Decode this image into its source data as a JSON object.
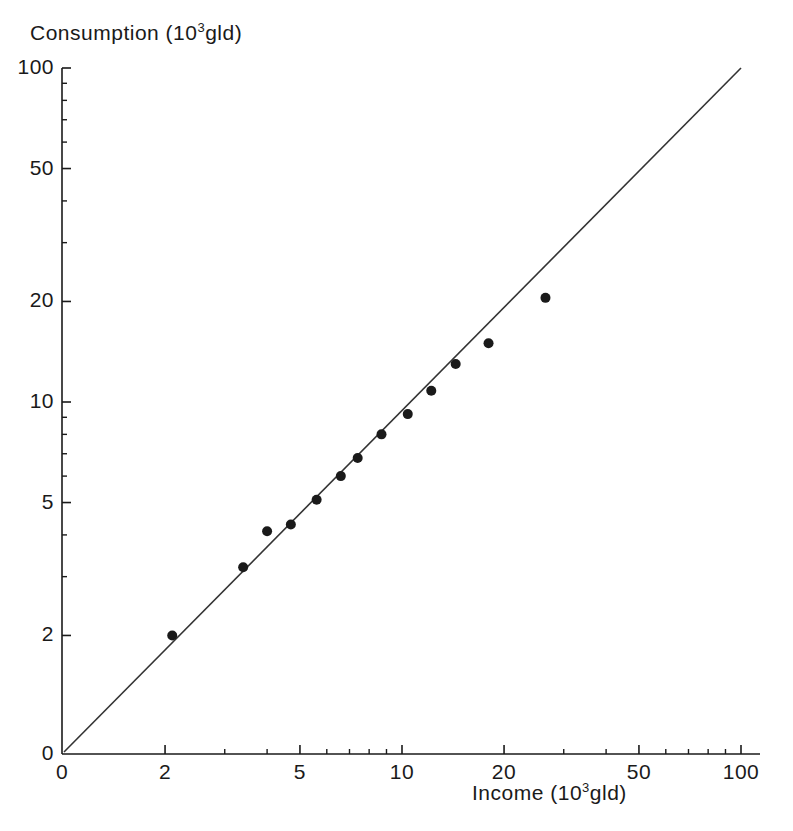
{
  "chart_data": {
    "type": "scatter",
    "title": "",
    "xlabel": "Income (10^3 gld)",
    "ylabel": "Consumption (10^3 gld)",
    "xlabel_main": "Income",
    "xlabel_unit_pre": "(10",
    "xlabel_unit_exp": "3",
    "xlabel_unit_post": "gld)",
    "ylabel_main": "Consumption",
    "ylabel_unit_pre": "(10",
    "ylabel_unit_exp": "3",
    "ylabel_unit_post": "gld)",
    "xscale": "log",
    "yscale": "log",
    "xlim": [
      1.55,
      110
    ],
    "ylim": [
      1.55,
      110
    ],
    "grid": false,
    "legend": "none",
    "x_ticks_major": [
      2,
      5,
      10,
      20,
      50,
      100
    ],
    "x_tick_labels": [
      "0",
      "2",
      "5",
      "10",
      "20",
      "50",
      "100"
    ],
    "x_origin_label": "0",
    "y_ticks_major": [
      2,
      5,
      10,
      20,
      50,
      100
    ],
    "y_tick_labels": [
      "0",
      "2",
      "5",
      "10",
      "20",
      "50",
      "100"
    ],
    "y_origin_label": "0",
    "x_ticks_minor": [
      3,
      4,
      6,
      7,
      8,
      9,
      30,
      40,
      60,
      70,
      80,
      90
    ],
    "y_ticks_minor": [
      3,
      4,
      6,
      7,
      8,
      9,
      30,
      40,
      60,
      70,
      80,
      90
    ],
    "reference_line": {
      "name": "identity-line",
      "from": [
        0,
        0
      ],
      "to": [
        100,
        100
      ],
      "label": "y = x"
    },
    "series": [
      {
        "name": "households",
        "marker": "filled-circle",
        "marker_color": "#1a1a1a",
        "points": [
          {
            "x": 2.1,
            "y": 2.0
          },
          {
            "x": 3.4,
            "y": 3.2
          },
          {
            "x": 4.0,
            "y": 4.1
          },
          {
            "x": 4.7,
            "y": 4.3
          },
          {
            "x": 5.6,
            "y": 5.1
          },
          {
            "x": 6.6,
            "y": 6.0
          },
          {
            "x": 7.4,
            "y": 6.8
          },
          {
            "x": 8.7,
            "y": 8.0
          },
          {
            "x": 10.4,
            "y": 9.2
          },
          {
            "x": 12.2,
            "y": 10.8
          },
          {
            "x": 14.4,
            "y": 13.0
          },
          {
            "x": 18.0,
            "y": 15.0
          },
          {
            "x": 26.5,
            "y": 20.5
          }
        ]
      }
    ]
  },
  "colors": {
    "axis": "#1a1a1a",
    "marker": "#1a1a1a",
    "line": "#333333",
    "background": "#ffffff"
  }
}
